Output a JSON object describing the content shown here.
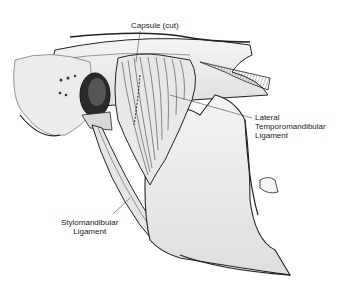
{
  "figure": {
    "type": "anatomical illustration",
    "labels": {
      "capsule": "Capsule (cut)",
      "lateral_ligament": {
        "line1": "Lateral",
        "line2": "Temporomandibular",
        "line3": "Ligament"
      },
      "stylomandibular": {
        "line1": "Stylomandibular",
        "line2": "Ligament"
      }
    }
  }
}
